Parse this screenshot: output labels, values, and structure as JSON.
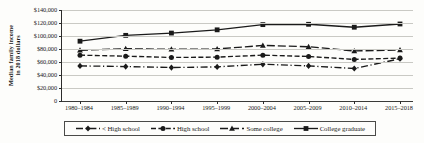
{
  "chart_data": {
    "type": "line",
    "title": "",
    "xlabel": "",
    "ylabel": "Median family income in 2018 dollars",
    "ylabel_lines": [
      "Median family income",
      "in 2018 dollars"
    ],
    "categories": [
      "1980–1984",
      "1985–1989",
      "1990–1994",
      "1995–1999",
      "2000–2004",
      "2005–2009",
      "2010–2014",
      "2015–2018"
    ],
    "ylim": [
      0,
      140000
    ],
    "ytick_values": [
      0,
      20000,
      40000,
      60000,
      80000,
      100000,
      120000,
      140000
    ],
    "ytick_labels": [
      "0",
      "$20,000",
      "$40,000",
      "$60,000",
      "$80,000",
      "$100,000",
      "$120,000",
      "$140,000"
    ],
    "grid": true,
    "legend_position": "bottom",
    "series": [
      {
        "name": "< High school",
        "marker": "diamond",
        "line_style": "dash-dot",
        "color": "#1a1a1a",
        "values": [
          54000,
          53000,
          51500,
          52500,
          56500,
          54000,
          50000,
          65000
        ]
      },
      {
        "name": "High school",
        "marker": "circle",
        "line_style": "dashed",
        "color": "#1a1a1a",
        "values": [
          70500,
          69000,
          67000,
          67500,
          70500,
          68500,
          64000,
          66000
        ]
      },
      {
        "name": "Some college",
        "marker": "triangle",
        "line_style": "long-dash",
        "color": "#1a1a1a",
        "values": [
          78000,
          80500,
          79500,
          80000,
          85500,
          83500,
          77000,
          78500
        ]
      },
      {
        "name": "College graduate",
        "marker": "square",
        "line_style": "solid",
        "color": "#1a1a1a",
        "values": [
          92000,
          101000,
          104500,
          109500,
          117500,
          118000,
          113500,
          118500
        ]
      }
    ]
  }
}
